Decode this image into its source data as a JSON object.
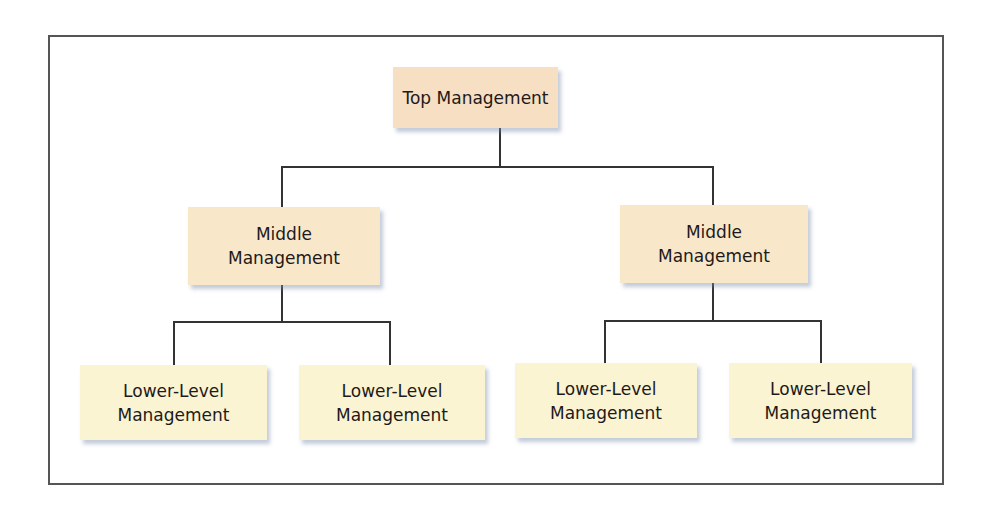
{
  "diagram": {
    "type": "org-chart",
    "top": {
      "label": "Top Management",
      "color": "#f7dfc3"
    },
    "middle": [
      {
        "line1": "Middle",
        "line2": "Management",
        "color": "#f9e7c9"
      },
      {
        "line1": "Middle",
        "line2": "Management",
        "color": "#f9e7c9"
      }
    ],
    "lower": [
      {
        "line1": "Lower-Level",
        "line2": "Management",
        "color": "#fbf4d3"
      },
      {
        "line1": "Lower-Level",
        "line2": "Management",
        "color": "#fbf4d3"
      },
      {
        "line1": "Lower-Level",
        "line2": "Management",
        "color": "#fbf4d3"
      },
      {
        "line1": "Lower-Level",
        "line2": "Management",
        "color": "#fbf4d3"
      }
    ]
  }
}
